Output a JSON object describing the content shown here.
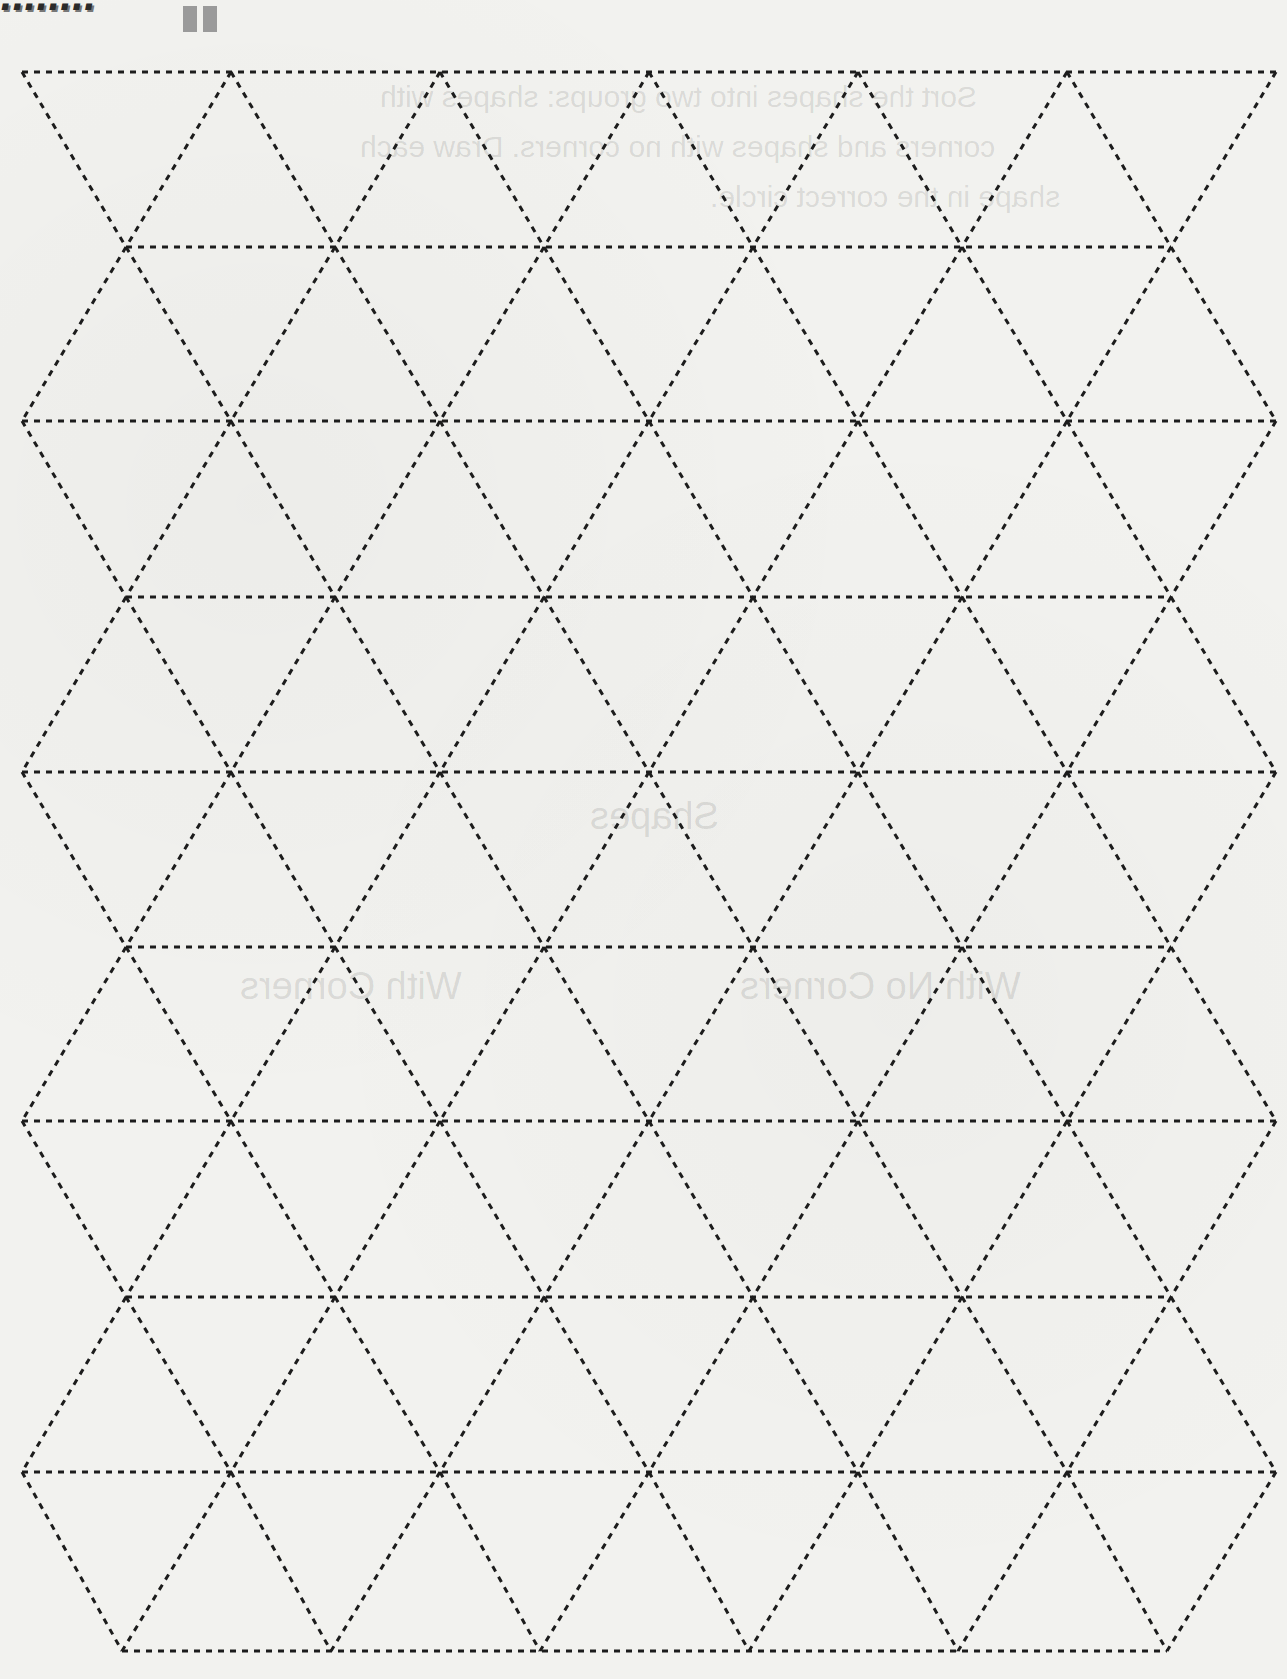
{
  "page": {
    "type": "printable-worksheet-scan",
    "logo_fragment": "........",
    "background_color": "#f2f2ef",
    "line_color": "#1c1c1c"
  },
  "bleed_through": {
    "lines": [
      "Sort the shapes into two groups: shapes with",
      "corners and shapes with no corners. Draw each",
      "shape in the correct circle."
    ],
    "title": "Shapes",
    "labels": [
      "With Corners",
      "With No Corners"
    ]
  },
  "grid": {
    "type": "triangle",
    "row_y": [
      72,
      247,
      421,
      597,
      772,
      947,
      1121,
      1297,
      1472,
      1651
    ],
    "even_row_x": [
      22,
      231,
      440,
      649,
      858,
      1067,
      1276
    ],
    "odd_row_x": [
      126,
      335,
      544,
      753,
      962,
      1171
    ],
    "rows": 10,
    "triangle_side_px": 209,
    "row_height_px": 175.5,
    "stroke": "dashed"
  }
}
